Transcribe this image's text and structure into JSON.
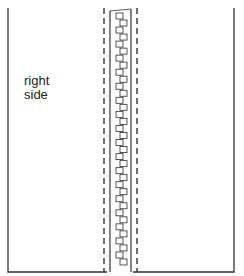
{
  "diagram": {
    "label": "right\nside",
    "label_lines": [
      "right",
      "side"
    ],
    "zipper_teeth_count": 36,
    "colors": {
      "line": "#333333",
      "background": "#ffffff"
    },
    "elements": [
      {
        "name": "left-fabric-panel",
        "style": "solid"
      },
      {
        "name": "left-stitch-line",
        "style": "dashed"
      },
      {
        "name": "zipper-tape-left-edge",
        "style": "solid"
      },
      {
        "name": "zipper-teeth",
        "style": "interlocking squares"
      },
      {
        "name": "zipper-tape-right-edge",
        "style": "solid"
      },
      {
        "name": "right-stitch-line",
        "style": "dashed"
      },
      {
        "name": "right-fabric-panel",
        "style": "solid"
      }
    ]
  }
}
